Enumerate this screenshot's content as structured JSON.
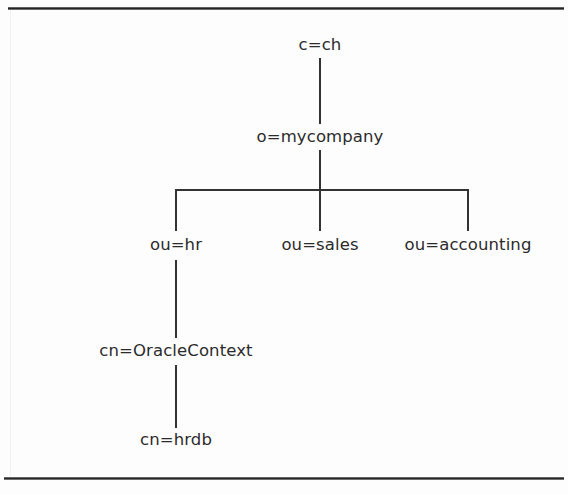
{
  "figure": {
    "kind": "ldap-directory-tree",
    "title": "",
    "background_color": "#fdfdfd",
    "line_color": "#333333",
    "text_color": "#2b2b2b"
  },
  "frame": {
    "top_rule_label": "top-page-rule",
    "bottom_rule_label": "bottom-page-rule",
    "left_rule_label": "left-page-rule"
  },
  "tree": {
    "nodes": [
      {
        "id": "root",
        "label": "c=ch",
        "x": 320,
        "y": 45,
        "level": 0
      },
      {
        "id": "org",
        "label": "o=mycompany",
        "x": 320,
        "y": 137,
        "level": 1
      },
      {
        "id": "ou-hr",
        "label": "ou=hr",
        "x": 176,
        "y": 245,
        "level": 2
      },
      {
        "id": "ou-sales",
        "label": "ou=sales",
        "x": 320,
        "y": 245,
        "level": 2
      },
      {
        "id": "ou-accounting",
        "label": "ou=accounting",
        "x": 468,
        "y": 245,
        "level": 2
      },
      {
        "id": "oracle-ctx",
        "label": "cn=OracleContext",
        "x": 176,
        "y": 351,
        "level": 3
      },
      {
        "id": "hrdb",
        "label": "cn=hrdb",
        "x": 176,
        "y": 440,
        "level": 4
      }
    ],
    "edges": [
      {
        "id": "root-to-org",
        "type": "vertical",
        "x": 320,
        "y1": 58,
        "y2": 124
      },
      {
        "id": "org-to-bus",
        "type": "vertical",
        "x": 320,
        "y1": 150,
        "y2": 190
      },
      {
        "id": "ou-bus",
        "type": "horizontal",
        "x1": 176,
        "x2": 468,
        "y": 189
      },
      {
        "id": "bus-to-hr",
        "type": "vertical",
        "x": 176,
        "y1": 189,
        "y2": 231
      },
      {
        "id": "bus-to-sales",
        "type": "vertical",
        "x": 320,
        "y1": 189,
        "y2": 231
      },
      {
        "id": "bus-to-accounting",
        "type": "vertical",
        "x": 468,
        "y1": 189,
        "y2": 231
      },
      {
        "id": "hr-to-oraclectx",
        "type": "vertical",
        "x": 176,
        "y1": 260,
        "y2": 338
      },
      {
        "id": "oraclectx-to-hrdb",
        "type": "vertical",
        "x": 176,
        "y1": 365,
        "y2": 428
      }
    ]
  }
}
